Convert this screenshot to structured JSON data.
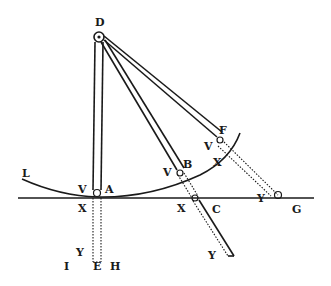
{
  "figure": {
    "type": "geometric pendulum diagram (engraving)",
    "labels": {
      "D": "D",
      "L": "L",
      "V_left": "V",
      "A": "A",
      "X_left": "X",
      "Y_left": "Y",
      "I": "I",
      "E": "E",
      "H": "H",
      "V_mid": "V",
      "B": "B",
      "X_mid": "X",
      "C": "C",
      "Y_mid": "Y",
      "V_right": "V",
      "F": "F",
      "X_right": "X",
      "Y_right": "Y",
      "G": "G"
    }
  }
}
